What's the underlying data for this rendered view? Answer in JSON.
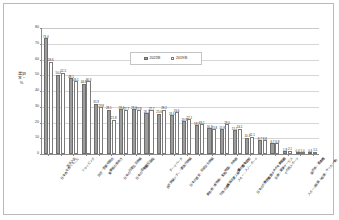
{
  "chart_data": {
    "type": "bar",
    "title": "",
    "xlabel": "",
    "ylabel": "選択率・%",
    "ylim": [
      0,
      80
    ],
    "ytick_step": 10,
    "yticks": [
      "0",
      "10",
      "20",
      "30",
      "40",
      "50",
      "60",
      "70",
      "80"
    ],
    "grid": true,
    "legend_position": "top-center",
    "categories": [
      "日本食を食べること",
      "温泉入浴",
      "ショッピング",
      "自然・景勝地観光",
      "繁華街の街歩き",
      "日本の日常生活体験",
      "日本の酒を飲むこと",
      "旅館に宿泊",
      "自然体験ツアー・農漁村体験",
      "テーマパーク",
      "日本の歴史・伝統文化体験",
      "美術館・博物館・動植物園・水族館",
      "四季の体感（花見・紅葉・雪など）",
      "映画・アニメ縁の地を訪問",
      "スキー・スノーボード",
      "日本のポップカルチャーを楽しむ",
      "舞台鑑賞・スポーツ観戦",
      "治療・健康サービス",
      "その他スポーツ",
      "スポーツ観戦（相撲・サッカー等）",
      "展示会・見本市",
      "その他"
    ],
    "series": [
      {
        "name": "2022年",
        "color": "#9c9c9c",
        "values": [
          73.4,
          50.4,
          48.1,
          44.6,
          31.9,
          28.1,
          28.4,
          28.6,
          26.1,
          25.6,
          24.6,
          20.8,
          18.2,
          16.3,
          15.8,
          15.1,
          10.3,
          8.7,
          6.7,
          1.8,
          0.4,
          0.4
        ]
      },
      {
        "name": "2019年",
        "color": "#ffffff",
        "values": [
          58.6,
          51.5,
          46.1,
          46.3,
          29.8,
          21.8,
          27.7,
          27.8,
          27.7,
          28.2,
          26.6,
          22.1,
          19.1,
          15.8,
          19.0,
          16.1,
          11.1,
          8.8,
          6.8,
          2.1,
          1.0,
          1.5
        ]
      }
    ],
    "value_labels_visible": true
  },
  "legend": {
    "items": [
      {
        "label": "2022年",
        "swatch": "filled-gray"
      },
      {
        "label": "2019年",
        "swatch": "outline-white"
      }
    ]
  },
  "axis": {
    "y_title": "選択率・%"
  }
}
